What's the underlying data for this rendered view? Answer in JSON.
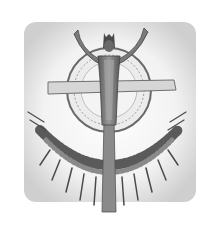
{
  "image": {
    "subject": "grayscale illustration of a robed figure with raised arms above a cross and circular halo, with a radiating crescent arc below",
    "colors": {
      "background": "#ffffff",
      "vignette": "#d9d9d9",
      "figure": "#6e6e6e",
      "dark": "#3a3a3a",
      "halo": "#9a9a9a"
    }
  }
}
